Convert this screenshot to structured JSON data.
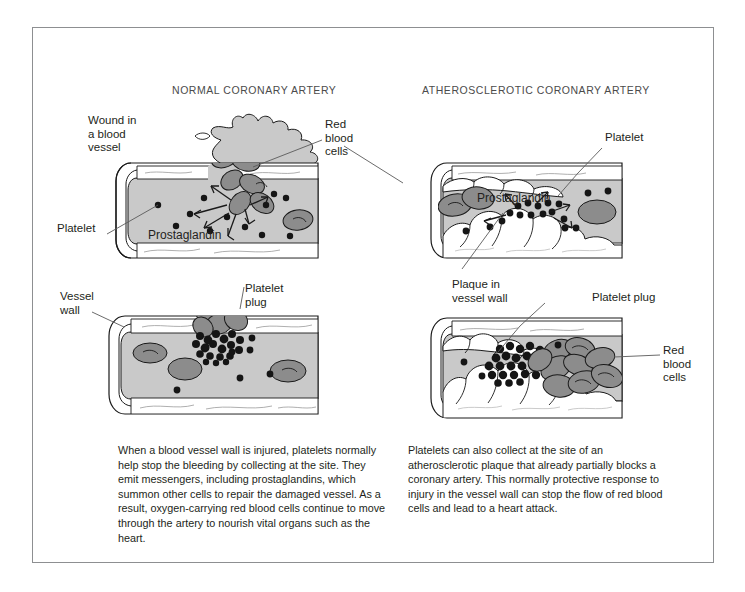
{
  "figure": {
    "title": "How the body’s natural wound healing can cause a heart attack",
    "panels": {
      "left_heading": "NORMAL CORONARY ARTERY",
      "right_heading": "ATHEROSCLEROTIC CORONARY ARTERY"
    },
    "labels": {
      "wound": "Wound in\na blood\nvessel",
      "red_blood_cells_left": "Red\nblood\ncells",
      "platelet_left": "Platelet",
      "prostaglandin_left": "Prostaglandin",
      "vessel_wall": "Vessel\nwall",
      "platelet_plug_left": "Platelet\nplug",
      "platelet_right": "Platelet",
      "prostaglandin_right": "Prostaglandin",
      "plaque": "Plaque in\nvessel wall",
      "platelet_plug_right": "Platelet plug",
      "red_blood_cells_right": "Red\nblood\ncells"
    },
    "captions": {
      "left": "When a blood vessel wall is injured, platelets normally help stop the bleeding by collecting at the site. They emit messengers, including prostaglandins, which summon other cells to repair the damaged vessel. As a result, oxygen-carrying red blood cells continue to move through the artery to nourish vital organs such as the heart.",
      "right": "Platelets can also collect at the site of an atherosclerotic plaque that already partially blocks a coronary artery. This normally protective response to injury in the vessel wall can stop the flow of red blood cells and lead to a heart attack."
    },
    "colors": {
      "frame": "#8d8f91",
      "lumen": "#c9c9c9",
      "red_blood_cell": "#8c8c8c",
      "platelet_dot": "#151515",
      "vessel_wall": "#ffffff",
      "plaque": "#ffffff",
      "outline": "#1a1a1a",
      "leader_line": "#5a5a5a",
      "text": "#231f20",
      "heading_text": "#4b4b4b"
    }
  }
}
